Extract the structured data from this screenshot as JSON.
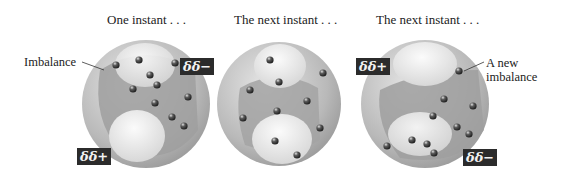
{
  "panels": [
    {
      "caption": "One instant . . .",
      "cx": 146,
      "cy": 104,
      "badges": [
        {
          "text": "δδ−",
          "x": 180,
          "y": 56
        },
        {
          "text": "δδ+",
          "x": 77,
          "y": 147
        }
      ],
      "electrons": [
        [
          116,
          65
        ],
        [
          139,
          60
        ],
        [
          175,
          63
        ],
        [
          150,
          75
        ],
        [
          157,
          85
        ],
        [
          133,
          89
        ],
        [
          188,
          97
        ],
        [
          155,
          103
        ],
        [
          172,
          117
        ],
        [
          184,
          126
        ]
      ]
    },
    {
      "caption": "The next instant . . .",
      "cx": 279,
      "cy": 104,
      "badges": [],
      "electrons": [
        [
          270,
          60
        ],
        [
          323,
          73
        ],
        [
          279,
          82
        ],
        [
          250,
          90
        ],
        [
          307,
          101
        ],
        [
          277,
          111
        ],
        [
          243,
          118
        ],
        [
          320,
          128
        ],
        [
          275,
          141
        ],
        [
          297,
          155
        ]
      ]
    },
    {
      "caption": "The next instant . . .",
      "cx": 425,
      "cy": 104,
      "badges": [
        {
          "text": "δδ+",
          "x": 358,
          "y": 58
        },
        {
          "text": "δδ−",
          "x": 463,
          "y": 149
        }
      ],
      "electrons": [
        [
          459,
          71
        ],
        [
          444,
          99
        ],
        [
          473,
          106
        ],
        [
          433,
          116
        ],
        [
          457,
          127
        ],
        [
          469,
          134
        ],
        [
          412,
          140
        ],
        [
          427,
          144
        ],
        [
          387,
          146
        ],
        [
          434,
          153
        ]
      ]
    }
  ],
  "annotations": {
    "imbalance": "Imbalance",
    "new_imbalance_line1": "A new",
    "new_imbalance_line2": "imbalance"
  },
  "colors": {
    "sphere": "#c9c9c9",
    "dense": "#9c9c9c",
    "light": "#ececec",
    "badge": "#2b2b2b",
    "electron": "#3a3a3a"
  }
}
